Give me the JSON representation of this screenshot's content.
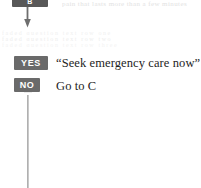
{
  "page": {
    "background_color": "#ffffff",
    "width": 201,
    "height": 188
  },
  "flowchart": {
    "top_node": {
      "label": "B",
      "fill_color": "#585858",
      "text_color": "#ffffff",
      "cropped": "true"
    },
    "connector": {
      "type": "down-arrow",
      "color": "#6e6e6e"
    },
    "ghost_text": {
      "top_right": "pain that lasts more than a few minutes",
      "band_line_1": "faded question text row one",
      "band_line_2": "faded question text row two",
      "band_line_3": "faded question text row three"
    },
    "answers": [
      {
        "badge": "YES",
        "badge_color": "#6a6a6a",
        "text": "“Seek emergency care now”"
      },
      {
        "badge": "NO",
        "badge_color": "#6a6a6a",
        "text": "Go to C"
      }
    ],
    "spine": {
      "color": "#b0b0b0",
      "orientation": "vertical"
    }
  }
}
